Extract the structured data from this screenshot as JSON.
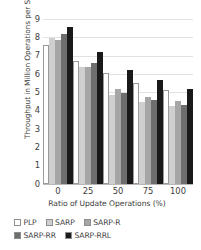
{
  "chart_data": {
    "type": "bar",
    "title": "",
    "xlabel": "Ratio of Update Operations (%)",
    "ylabel": "Throughput in Million Operations per Second",
    "categories": [
      "0",
      "25",
      "50",
      "75",
      "100"
    ],
    "ylim": [
      0,
      9
    ],
    "yticks": [
      0,
      1,
      2,
      3,
      4,
      5,
      6,
      7,
      8,
      9
    ],
    "ytick_labels": [
      "0",
      "1",
      "2",
      "3",
      "4",
      "5",
      "6",
      "7",
      "8",
      "9"
    ],
    "grid": true,
    "legend_position": "bottom",
    "series": [
      {
        "name": "PLP",
        "color": "#ffffff",
        "values": [
          7.5,
          6.6,
          5.95,
          5.4,
          5.0
        ]
      },
      {
        "name": "SARP",
        "color": "#cfcfcf",
        "values": [
          7.85,
          6.25,
          4.75,
          4.35,
          4.15
        ]
      },
      {
        "name": "SARP-R",
        "color": "#a6a6a6",
        "values": [
          7.75,
          6.3,
          5.1,
          4.65,
          4.4
        ]
      },
      {
        "name": "SARP-RR",
        "color": "#6e6e6e",
        "values": [
          8.1,
          6.5,
          4.85,
          4.45,
          4.2
        ]
      },
      {
        "name": "SARP-RRL",
        "color": "#1a1a1a",
        "values": [
          8.45,
          7.1,
          6.1,
          5.55,
          5.05
        ]
      }
    ]
  },
  "axis": {
    "x_title": "Ratio of Update Operations (%)",
    "y_title": "Throughput in Million Operations per Second"
  },
  "legend": {
    "row1": [
      {
        "label": "PLP",
        "color": "#ffffff"
      },
      {
        "label": "SARP",
        "color": "#cfcfcf"
      },
      {
        "label": "SARP-R",
        "color": "#a6a6a6"
      }
    ],
    "row2": [
      {
        "label": "SARP-RR",
        "color": "#6e6e6e"
      },
      {
        "label": "SARP-RRL",
        "color": "#1a1a1a"
      }
    ]
  }
}
